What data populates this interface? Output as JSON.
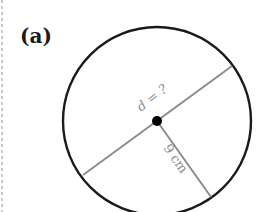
{
  "figure": {
    "label": "(a)",
    "diameter_label": "d = ?",
    "radius_label": "9 cm",
    "colors": {
      "circle": "#1a1a1a",
      "lines": "#8c8c8c",
      "center": "#000000",
      "text": "#8a8a8a"
    }
  }
}
